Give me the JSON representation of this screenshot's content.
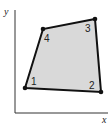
{
  "axes": {
    "x_label": "x",
    "y_label": "y"
  },
  "quad": {
    "fill": "#d9d9d9",
    "stroke": "#111111",
    "vertices": [
      {
        "label": "1",
        "x": 25,
        "y": 88
      },
      {
        "label": "2",
        "x": 101,
        "y": 92
      },
      {
        "label": "3",
        "x": 95,
        "y": 19
      },
      {
        "label": "4",
        "x": 43,
        "y": 29
      }
    ]
  }
}
